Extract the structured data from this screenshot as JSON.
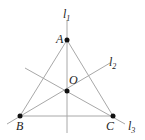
{
  "diagram": {
    "points": [
      {
        "id": "A",
        "label": "A",
        "x": 67,
        "y": 40,
        "lx": 56,
        "ly": 43
      },
      {
        "id": "B",
        "label": "B",
        "x": 20,
        "y": 116,
        "lx": 16,
        "ly": 130
      },
      {
        "id": "C",
        "label": "C",
        "x": 113,
        "y": 116,
        "lx": 106,
        "ly": 130
      },
      {
        "id": "O",
        "label": "O",
        "x": 67,
        "y": 91,
        "lx": 69,
        "ly": 84
      }
    ],
    "lines": [
      {
        "id": "l1",
        "label": "l",
        "sub": "1",
        "x1": 67,
        "y1": 20,
        "x2": 67,
        "y2": 133,
        "lx": 64,
        "ly": 18
      },
      {
        "id": "l2",
        "label": "l",
        "sub": "2",
        "x1": 7,
        "y1": 124,
        "x2": 110,
        "y2": 63,
        "lx": 109,
        "ly": 65
      },
      {
        "id": "l3",
        "label": "l",
        "sub": "3",
        "x1": 25,
        "y1": 68,
        "x2": 125,
        "y2": 124,
        "lx": 128,
        "ly": 130
      }
    ],
    "segments": [
      {
        "id": "AB",
        "from": "A",
        "to": "B"
      },
      {
        "id": "AC",
        "from": "A",
        "to": "C"
      },
      {
        "id": "BC",
        "from": "B",
        "to": "C"
      }
    ],
    "colors": {
      "line": "#a8a8a8",
      "point": "#111111",
      "text": "#222222"
    }
  }
}
